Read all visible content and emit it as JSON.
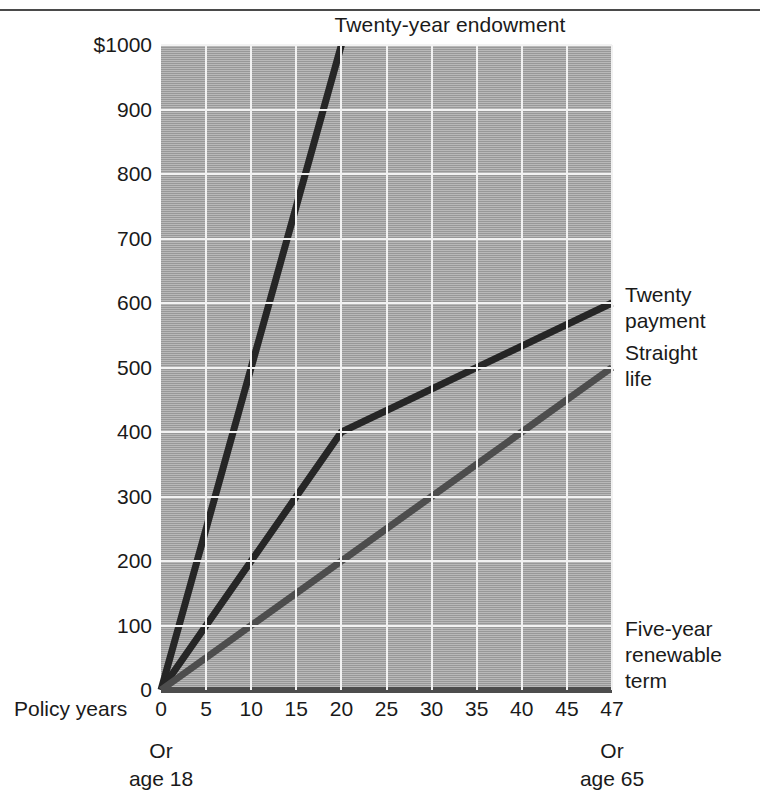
{
  "chart_data": {
    "type": "line",
    "title": "Twenty-year endowment",
    "xlabel": "Policy years",
    "ylabel": "",
    "xlim": [
      0,
      47
    ],
    "ylim": [
      0,
      1000
    ],
    "grid": true,
    "legend_position": "right-of-plot (inline labels at line ends)",
    "xticks": [
      0,
      5,
      10,
      15,
      20,
      25,
      30,
      35,
      40,
      45,
      47
    ],
    "xtick_labels": [
      "0",
      "5",
      "10",
      "15",
      "20",
      "25",
      "30",
      "35",
      "40",
      "45",
      "47"
    ],
    "yticks": [
      0,
      100,
      200,
      300,
      400,
      500,
      600,
      700,
      800,
      900,
      1000
    ],
    "ytick_labels": [
      "0",
      "100",
      "200",
      "300",
      "400",
      "500",
      "600",
      "700",
      "800",
      "900",
      "$1000"
    ],
    "annotations": [
      {
        "name": "left-age-note",
        "text": "Or\nage 18",
        "at_x": 0
      },
      {
        "name": "right-age-note",
        "text": "Or\nage 65",
        "at_x": 47
      }
    ],
    "series": [
      {
        "name": "Twenty-year endowment",
        "label": "Twenty-year endowment",
        "color": "#262626",
        "x": [
          0,
          20
        ],
        "y": [
          0,
          1000
        ]
      },
      {
        "name": "Twenty payment",
        "label": "Twenty\npayment",
        "color": "#262626",
        "x": [
          0,
          20,
          47
        ],
        "y": [
          0,
          400,
          600
        ]
      },
      {
        "name": "Straight life",
        "label": "Straight\nlife",
        "color": "#4d4d4d",
        "x": [
          0,
          47
        ],
        "y": [
          0,
          500
        ]
      },
      {
        "name": "Five-year renewable term",
        "label": "Five-year\nrenewable\nterm",
        "color": "#4d4d4d",
        "x": [
          0,
          47
        ],
        "y": [
          0,
          0
        ]
      }
    ]
  },
  "figure": {
    "title": "Twenty-year endowment",
    "xaxis_label": "Policy years",
    "left_age_note": "Or\nage 18",
    "right_age_note": "Or\nage 65",
    "series_labels": {
      "twenty_payment": "Twenty\npayment",
      "straight_life": "Straight\nlife",
      "five_year_term": "Five-year\nrenewable\nterm"
    },
    "colors": {
      "plot_background": "#a9a9a9",
      "gridline": "#f2f2f2",
      "line_dark": "#262626",
      "line_mid": "#4d4d4d",
      "text": "#1a1a1a",
      "rule": "#4a4a4a"
    }
  }
}
